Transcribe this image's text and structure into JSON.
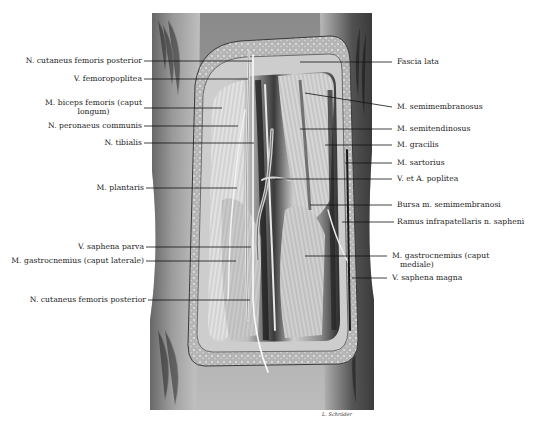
{
  "figure": {
    "signature": "L. Schröder"
  },
  "labels_left": [
    {
      "id": "n-cutaneus-femoris-posterior-upper",
      "text": "N. cutaneus femoris posterior",
      "line2": "",
      "y": 61,
      "target_x": 252
    },
    {
      "id": "v-femoropoplitea",
      "text": "V. femoropoplitea",
      "line2": "",
      "y": 79,
      "target_x": 248
    },
    {
      "id": "m-biceps-femoris-caput-longum",
      "text": "M. biceps femoris (caput",
      "line2": "longum)",
      "y": 108,
      "target_x": 222
    },
    {
      "id": "n-peronaeus-communis",
      "text": "N. peronaeus communis",
      "line2": "",
      "y": 126,
      "target_x": 238
    },
    {
      "id": "n-tibialis",
      "text": "N. tibialis",
      "line2": "",
      "y": 143,
      "target_x": 254
    },
    {
      "id": "m-plantaris",
      "text": "M. plantaris",
      "line2": "",
      "y": 188,
      "target_x": 237
    },
    {
      "id": "v-saphena-parva",
      "text": "V. saphena parva",
      "line2": "",
      "y": 247,
      "target_x": 251
    },
    {
      "id": "m-gastrocnemius-caput-laterale",
      "text": "M. gastrocnemius (caput laterale)",
      "line2": "",
      "y": 261,
      "target_x": 236
    },
    {
      "id": "n-cutaneus-femoris-posterior-lower",
      "text": "N. cutaneus femoris posterior",
      "line2": "",
      "y": 300,
      "target_x": 250
    }
  ],
  "labels_right": [
    {
      "id": "fascia-lata",
      "text": "Fascia lata",
      "line2": "",
      "y": 62,
      "target_x": 300
    },
    {
      "id": "m-semimembranosus",
      "text": "M. semimembranosus",
      "line2": "",
      "y": 107,
      "target_x": 305
    },
    {
      "id": "m-semitendinosus",
      "text": "M. semitendinosus",
      "line2": "",
      "y": 129,
      "target_x": 300
    },
    {
      "id": "m-gracilis",
      "text": "M. gracilis",
      "line2": "",
      "y": 145,
      "target_x": 325
    },
    {
      "id": "m-sartorius",
      "text": "M. sartorius",
      "line2": "",
      "y": 163,
      "target_x": 345
    },
    {
      "id": "v-et-a-poplitea",
      "text": "V. et A. poplitea",
      "line2": "",
      "y": 179,
      "target_x": 275
    },
    {
      "id": "bursa-m-semimembranosi",
      "text": "Bursa m. semimembranosi",
      "line2": "",
      "y": 205,
      "target_x": 310
    },
    {
      "id": "ramus-infrapatellaris-n-sapheni",
      "text": "Ramus infrapatellaris n. sapheni",
      "line2": "",
      "y": 222,
      "target_x": 342
    },
    {
      "id": "m-gastrocnemius-caput-mediale",
      "text": "M. gastrocnemius (caput",
      "line2": "mediale)",
      "y": 256,
      "target_x": 305
    },
    {
      "id": "v-saphena-magna",
      "text": "V. saphena magna",
      "line2": "",
      "y": 278,
      "target_x": 352
    }
  ]
}
